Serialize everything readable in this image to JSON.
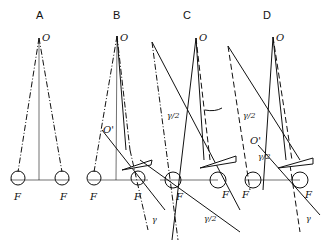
{
  "figure": {
    "panels": [
      {
        "id": "A",
        "title": "A",
        "point_O": "O",
        "left_eye": "F",
        "right_eye": "F"
      },
      {
        "id": "B",
        "title": "B",
        "point_O": "O",
        "point_O_prime": "O'",
        "left_eye": "F",
        "right_eye": "F",
        "angle": "γ"
      },
      {
        "id": "C",
        "title": "C",
        "point_O": "O",
        "angle_top": "γ/2",
        "angle_bottom": "γ/2",
        "left_eye": "F",
        "right_eye": "F"
      },
      {
        "id": "D",
        "title": "D",
        "point_O": "O",
        "point_O_prime": "O'",
        "angle_top": "γ/2",
        "angle_mid": "γ/2",
        "angle_bottom": "γ",
        "left_eye": "F",
        "right_eye": "F"
      }
    ]
  }
}
